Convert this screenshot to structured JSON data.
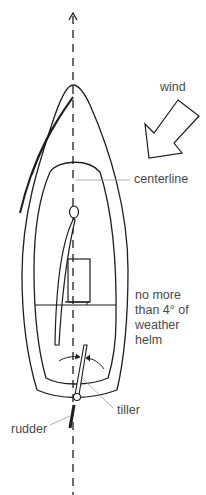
{
  "diagram": {
    "labels": {
      "wind": "wind",
      "centerline": "centerline",
      "helm_note_1": "no more",
      "helm_note_2": "than 4° of",
      "helm_note_3": "weather",
      "helm_note_4": "helm",
      "tiller": "tiller",
      "rudder": "rudder"
    },
    "colors": {
      "line": "#1e1e1e",
      "leader": "#9a9a9a",
      "text": "#4a4a4a",
      "background": "#ffffff"
    },
    "max_weather_helm_degrees": 4
  }
}
